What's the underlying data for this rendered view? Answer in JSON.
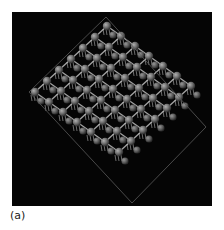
{
  "figure": {
    "panel_label": "(a)",
    "background_color": "#050505",
    "cell_outline_color": "#5a5a5a",
    "atom_color": "#7a7a7a",
    "atom_highlight_color": "#a8a8a8",
    "bond_color": "#d8d8d8",
    "cell_outline": {
      "vertices": [
        [
          94,
          5
        ],
        [
          194,
          115
        ],
        [
          120,
          191
        ],
        [
          17,
          80
        ]
      ]
    },
    "lattice": {
      "origin": [
        95,
        14
      ],
      "a": [
        14,
        10
      ],
      "b": [
        -12,
        11
      ],
      "rows": 7,
      "cols": 7,
      "atom_radius": 4.2
    }
  }
}
